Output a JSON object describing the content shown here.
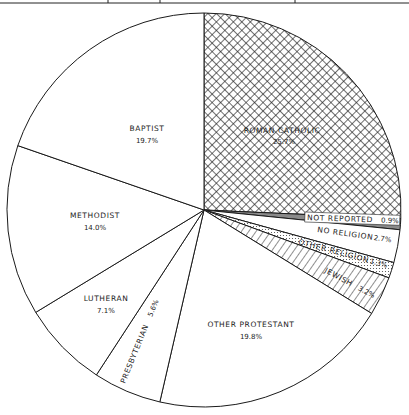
{
  "chart_data": {
    "type": "pie",
    "title": "",
    "start_angle_deg": 0,
    "direction": "clockwise",
    "categories": [
      "Roman Catholic",
      "Not Reported",
      "No Religion",
      "Other Religion",
      "Jewish",
      "Other Protestant",
      "Presbyterian",
      "Lutheran",
      "Methodist",
      "Baptist"
    ],
    "values": [
      25.7,
      0.9,
      2.7,
      1.3,
      3.2,
      19.8,
      5.6,
      7.1,
      14.0,
      19.7
    ],
    "slices": [
      {
        "label": "ROMAN CATHOLIC",
        "pct_text": "25.7%",
        "value": 25.7,
        "fill": "crosshatch"
      },
      {
        "label": "NOT REPORTED",
        "pct_text": "0.9%",
        "value": 0.9,
        "fill": "gray"
      },
      {
        "label": "NO RELIGION",
        "pct_text": "2.7%",
        "value": 2.7,
        "fill": "white"
      },
      {
        "label": "OTHER RELIGION",
        "pct_text": "1.3%",
        "value": 1.3,
        "fill": "dots"
      },
      {
        "label": "JEWISH",
        "pct_text": "3.2%",
        "value": 3.2,
        "fill": "diagonal"
      },
      {
        "label": "OTHER PROTESTANT",
        "pct_text": "19.8%",
        "value": 19.8,
        "fill": "white"
      },
      {
        "label": "PRESBYTERIAN",
        "pct_text": "5.6%",
        "value": 5.6,
        "fill": "white"
      },
      {
        "label": "LUTHERAN",
        "pct_text": "7.1%",
        "value": 7.1,
        "fill": "white"
      },
      {
        "label": "METHODIST",
        "pct_text": "14.0%",
        "value": 14.0,
        "fill": "white"
      },
      {
        "label": "BAPTIST",
        "pct_text": "19.7%",
        "value": 19.7,
        "fill": "white"
      }
    ],
    "legend": "none (labels inside slices)"
  },
  "colors": {
    "stroke": "#1a1a1a",
    "gray_fill": "#8a8a8a",
    "background": "#ffffff"
  }
}
